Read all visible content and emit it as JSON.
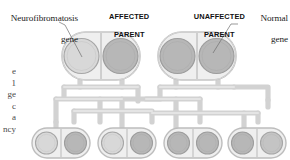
{
  "diagram": {
    "labels": {
      "nf_gene_line1": "Neurofibromatosis",
      "nf_gene_line2": "gene",
      "normal_gene_line1": "Normal",
      "normal_gene_line2": "gene",
      "affected_parent_line1": "AFFECTED",
      "affected_parent_line2": "PARENT",
      "unaffected_parent_line1": "UNAFFECTED",
      "unaffected_parent_line2": "PARENT"
    },
    "margin_fragments": [
      "e",
      "1",
      "ge",
      "c",
      "a",
      "ncy"
    ],
    "colors": {
      "background": "#ffffff",
      "text": "#1b1b1b",
      "cell_fill": "#efefef",
      "cell_stroke": "#b9b9b9",
      "gene_light": "#d8d8d8",
      "gene_dark": "#b5b5b5",
      "gene_stroke": "#9d9d9d",
      "tube_fill": "#d2d2d2",
      "tube_stroke": "#c4c4c4",
      "leader_line": "#6e6e6e"
    },
    "parents": [
      {
        "name": "affected-parent",
        "x": 62,
        "y": 32,
        "w": 78,
        "h": 48,
        "genes": [
          {
            "name": "neurofibromatosis-gene",
            "shade": "light",
            "side": "left"
          },
          {
            "name": "normal-gene",
            "shade": "dark",
            "side": "right"
          }
        ]
      },
      {
        "name": "unaffected-parent",
        "x": 158,
        "y": 32,
        "w": 78,
        "h": 48,
        "genes": [
          {
            "name": "normal-gene",
            "shade": "dark",
            "side": "left"
          },
          {
            "name": "normal-gene",
            "shade": "dark",
            "side": "right"
          }
        ]
      }
    ],
    "children": [
      {
        "name": "child-1",
        "x": 32,
        "y": 128,
        "w": 58,
        "h": 30,
        "genes": [
          {
            "name": "neurofibromatosis-gene",
            "shade": "light",
            "side": "left"
          },
          {
            "name": "normal-gene",
            "shade": "dark",
            "side": "right"
          }
        ]
      },
      {
        "name": "child-2",
        "x": 98,
        "y": 128,
        "w": 58,
        "h": 30,
        "genes": [
          {
            "name": "neurofibromatosis-gene",
            "shade": "light",
            "side": "left"
          },
          {
            "name": "normal-gene",
            "shade": "dark",
            "side": "right"
          }
        ]
      },
      {
        "name": "child-3",
        "x": 164,
        "y": 128,
        "w": 58,
        "h": 30,
        "genes": [
          {
            "name": "normal-gene",
            "shade": "dark",
            "side": "left"
          },
          {
            "name": "normal-gene",
            "shade": "dark",
            "side": "right"
          }
        ]
      },
      {
        "name": "child-4",
        "x": 228,
        "y": 128,
        "w": 58,
        "h": 30,
        "genes": [
          {
            "name": "normal-gene",
            "shade": "dark",
            "side": "left"
          },
          {
            "name": "normal-gene",
            "shade": "light",
            "side": "right"
          }
        ]
      }
    ]
  }
}
